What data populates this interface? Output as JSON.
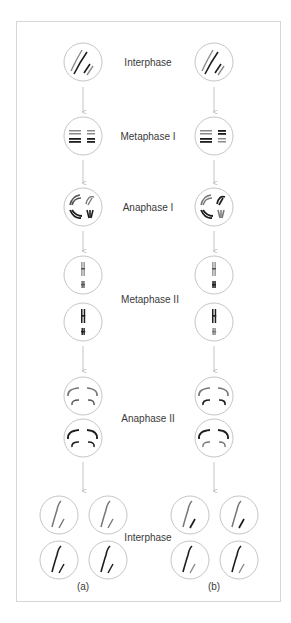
{
  "figure": {
    "stages": [
      {
        "id": "interphase-start",
        "label": "Interphase",
        "label_x": 148,
        "label_y": 62
      },
      {
        "id": "metaphase-1",
        "label": "Metaphase I",
        "label_x": 148,
        "label_y": 136
      },
      {
        "id": "anaphase-1",
        "label": "Anaphase I",
        "label_x": 148,
        "label_y": 207
      },
      {
        "id": "metaphase-2",
        "label": "Metaphase II",
        "label_x": 150,
        "label_y": 299
      },
      {
        "id": "anaphase-2",
        "label": "Anaphase II",
        "label_x": 148,
        "label_y": 418
      },
      {
        "id": "interphase-end",
        "label": "Interphase",
        "label_x": 148,
        "label_y": 537
      }
    ],
    "columns": [
      {
        "id": "a",
        "caption": "(a)",
        "center_x": 83
      },
      {
        "id": "b",
        "caption": "(b)",
        "center_x": 214
      }
    ],
    "colors": {
      "cell_outline": "#bdbdbd",
      "arrow": "#b5b5b5",
      "chromosome_dark": "#1e1e1e",
      "chromosome_gray": "#8a8a8a",
      "frame_border": "#d6d6d6",
      "text": "#3a3a3a"
    }
  }
}
